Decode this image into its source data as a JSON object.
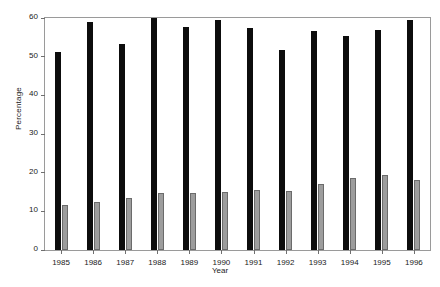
{
  "chart_data": {
    "type": "bar",
    "title": "",
    "xlabel": "Year",
    "ylabel": "Percentage",
    "categories": [
      "1985",
      "1986",
      "1987",
      "1988",
      "1989",
      "1990",
      "1991",
      "1992",
      "1993",
      "1994",
      "1995",
      "1996"
    ],
    "series": [
      {
        "name": "black-series",
        "color": "#0d0d0d",
        "values": [
          51.2,
          58.9,
          53.3,
          60.0,
          57.8,
          59.6,
          57.4,
          51.6,
          56.7,
          55.3,
          56.8,
          59.4
        ]
      },
      {
        "name": "gray-series",
        "color": "#9d9d9d",
        "values": [
          11.6,
          12.5,
          13.5,
          14.7,
          14.8,
          15.0,
          15.5,
          15.2,
          17.0,
          18.5,
          19.4,
          18.2
        ]
      }
    ],
    "ylim": [
      0,
      60
    ],
    "yticks": [
      0,
      10,
      20,
      30,
      40,
      50,
      60
    ],
    "ytick_labels": [
      "0",
      "10",
      "20",
      "30",
      "40",
      "50",
      "60"
    ],
    "grid": false,
    "legend": "none"
  }
}
